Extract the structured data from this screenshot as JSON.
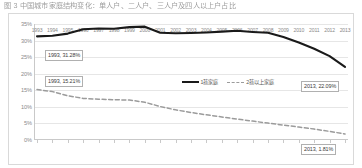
{
  "caption": "图 3  中国城市家庭结构变化：单人户、二人户、三人户及四人以上户占比",
  "chart_data": {
    "type": "line",
    "title": "",
    "subtitle": "",
    "xlabel": "",
    "ylabel": "",
    "x": [
      1993,
      1994,
      1995,
      1996,
      1997,
      1998,
      1999,
      2000,
      2001,
      2002,
      2003,
      2004,
      2005,
      2006,
      2007,
      2008,
      2009,
      2010,
      2011,
      2012,
      2013
    ],
    "ylim": [
      0,
      35
    ],
    "yticks": [
      "0%",
      "5%",
      "10%",
      "15%",
      "20%",
      "25%",
      "30%",
      "35%"
    ],
    "ytick_values": [
      0,
      5,
      10,
      15,
      20,
      25,
      30,
      35
    ],
    "xticks": [
      "1993",
      "1994",
      "1995",
      "1996",
      "1997",
      "1998",
      "1999",
      "2000",
      "2001",
      "2002",
      "2003",
      "2004",
      "2005",
      "2006",
      "2007",
      "2008",
      "2009",
      "2010",
      "2011",
      "2012",
      "2013"
    ],
    "grid": true,
    "legend_position": "center",
    "series": [
      {
        "name": "1孩家庭",
        "style": "solid",
        "color": "#1a1a1a",
        "values": [
          31.28,
          31.45,
          32.1,
          33.4,
          33.62,
          33.55,
          34.05,
          34.2,
          32.35,
          32.2,
          32.28,
          32.45,
          32.7,
          32.95,
          32.6,
          32.35,
          31.1,
          29.4,
          27.55,
          25.3,
          22.09
        ]
      },
      {
        "name": "2孩以上家庭",
        "style": "dashed",
        "color": "#9b9b9b",
        "values": [
          15.21,
          14.6,
          13.35,
          12.55,
          12.3,
          12.15,
          12.05,
          11.4,
          10.1,
          9.1,
          8.3,
          7.6,
          6.95,
          6.3,
          5.7,
          5.1,
          4.5,
          3.9,
          3.3,
          2.6,
          1.81
        ]
      }
    ],
    "annotations": [
      {
        "text": "1993, 31.28%",
        "series": "1孩家庭",
        "x": 1993,
        "y": 31.28
      },
      {
        "text": "2013, 22.09%",
        "series": "1孩家庭",
        "x": 2013,
        "y": 22.09
      },
      {
        "text": "1993, 15.21%",
        "series": "2孩以上家庭",
        "x": 1993,
        "y": 15.21
      },
      {
        "text": "2013, 1.81%",
        "series": "2孩以上家庭",
        "x": 2013,
        "y": 1.81
      }
    ]
  }
}
